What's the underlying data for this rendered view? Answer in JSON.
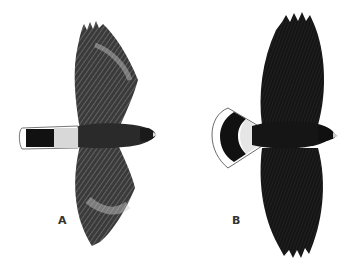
{
  "figure": {
    "birds": [
      {
        "label": "A",
        "tail": "dark tail with light base and white tip band, narrow",
        "plumage": "mottled brown-gray wings with barring"
      },
      {
        "label": "B",
        "tail": "fanned tail with white base, dark band and white fringed tip",
        "plumage": "very dark, nearly black"
      }
    ],
    "colors": {
      "background": "#ffffff",
      "bird_dark": "#1a1a1a",
      "bird_mid": "#4a4a4a",
      "bird_light": "#bdbdbd",
      "label": "#333333"
    }
  }
}
